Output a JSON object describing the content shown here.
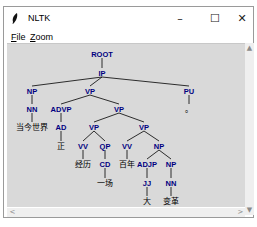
{
  "window": {
    "title": "NLTK",
    "controls": {
      "minimize": "–",
      "maximize": "☐",
      "close": "✕"
    }
  },
  "menu": {
    "items": [
      {
        "label": "File",
        "mnemonic": "F",
        "rest": "ile"
      },
      {
        "label": "Zoom",
        "mnemonic": "Z",
        "rest": "oom"
      }
    ]
  },
  "scrollbars": {
    "up": "▲",
    "down": "▼",
    "left": "<",
    "right": ">"
  },
  "colors": {
    "canvas": "#d9d9d9",
    "label": "#000080",
    "leaf": "#000000",
    "edge": "#000000"
  },
  "tree": {
    "nodes": [
      {
        "id": "root",
        "label": "ROOT",
        "x": 95,
        "y": 10,
        "type": "label"
      },
      {
        "id": "ip",
        "label": "IP",
        "x": 95,
        "y": 29,
        "type": "label"
      },
      {
        "id": "np1",
        "label": "NP",
        "x": 25,
        "y": 47,
        "type": "label"
      },
      {
        "id": "vp1",
        "label": "VP",
        "x": 83,
        "y": 47,
        "type": "label"
      },
      {
        "id": "pu",
        "label": "PU",
        "x": 182,
        "y": 47,
        "type": "label"
      },
      {
        "id": "nn1",
        "label": "NN",
        "x": 25,
        "y": 65,
        "type": "label"
      },
      {
        "id": "advp",
        "label": "ADVP",
        "x": 54,
        "y": 65,
        "type": "label"
      },
      {
        "id": "vp2",
        "label": "VP",
        "x": 112,
        "y": 65,
        "type": "label"
      },
      {
        "id": "pu_leaf",
        "label": "。",
        "x": 182,
        "y": 65,
        "type": "leaf"
      },
      {
        "id": "w1",
        "label": "当今世界",
        "x": 25,
        "y": 83,
        "type": "leaf"
      },
      {
        "id": "ad",
        "label": "AD",
        "x": 54,
        "y": 83,
        "type": "label"
      },
      {
        "id": "vp3",
        "label": "VP",
        "x": 87,
        "y": 83,
        "type": "label"
      },
      {
        "id": "vp4",
        "label": "VP",
        "x": 137,
        "y": 83,
        "type": "label"
      },
      {
        "id": "w2",
        "label": "正",
        "x": 54,
        "y": 102,
        "type": "leaf"
      },
      {
        "id": "vv1",
        "label": "VV",
        "x": 76,
        "y": 102,
        "type": "label"
      },
      {
        "id": "qp",
        "label": "QP",
        "x": 98,
        "y": 102,
        "type": "label"
      },
      {
        "id": "vv2",
        "label": "VV",
        "x": 120,
        "y": 102,
        "type": "label"
      },
      {
        "id": "np2",
        "label": "NP",
        "x": 152,
        "y": 102,
        "type": "label"
      },
      {
        "id": "w3",
        "label": "经历",
        "x": 76,
        "y": 120,
        "type": "leaf"
      },
      {
        "id": "cd",
        "label": "CD",
        "x": 98,
        "y": 120,
        "type": "label"
      },
      {
        "id": "w4",
        "label": "百年",
        "x": 120,
        "y": 120,
        "type": "leaf"
      },
      {
        "id": "adjp",
        "label": "ADJP",
        "x": 140,
        "y": 120,
        "type": "label"
      },
      {
        "id": "np3",
        "label": "NP",
        "x": 164,
        "y": 120,
        "type": "label"
      },
      {
        "id": "w5",
        "label": "一场",
        "x": 98,
        "y": 139,
        "type": "leaf"
      },
      {
        "id": "jj",
        "label": "JJ",
        "x": 140,
        "y": 139,
        "type": "label"
      },
      {
        "id": "nn2",
        "label": "NN",
        "x": 164,
        "y": 139,
        "type": "label"
      },
      {
        "id": "w6",
        "label": "大",
        "x": 140,
        "y": 157,
        "type": "leaf"
      },
      {
        "id": "w7",
        "label": "变革",
        "x": 164,
        "y": 157,
        "type": "leaf"
      }
    ],
    "edges": [
      [
        "root",
        "ip"
      ],
      [
        "ip",
        "np1"
      ],
      [
        "ip",
        "vp1"
      ],
      [
        "ip",
        "pu"
      ],
      [
        "np1",
        "nn1"
      ],
      [
        "vp1",
        "advp"
      ],
      [
        "vp1",
        "vp2"
      ],
      [
        "pu",
        "pu_leaf"
      ],
      [
        "nn1",
        "w1"
      ],
      [
        "advp",
        "ad"
      ],
      [
        "vp2",
        "vp3"
      ],
      [
        "vp2",
        "vp4"
      ],
      [
        "ad",
        "w2"
      ],
      [
        "vp3",
        "vv1"
      ],
      [
        "vp3",
        "qp"
      ],
      [
        "vp4",
        "vv2"
      ],
      [
        "vp4",
        "np2"
      ],
      [
        "vv1",
        "w3"
      ],
      [
        "qp",
        "cd"
      ],
      [
        "vv2",
        "w4"
      ],
      [
        "np2",
        "adjp"
      ],
      [
        "np2",
        "np3"
      ],
      [
        "cd",
        "w5"
      ],
      [
        "adjp",
        "jj"
      ],
      [
        "np3",
        "nn2"
      ],
      [
        "jj",
        "w6"
      ],
      [
        "nn2",
        "w7"
      ]
    ]
  }
}
